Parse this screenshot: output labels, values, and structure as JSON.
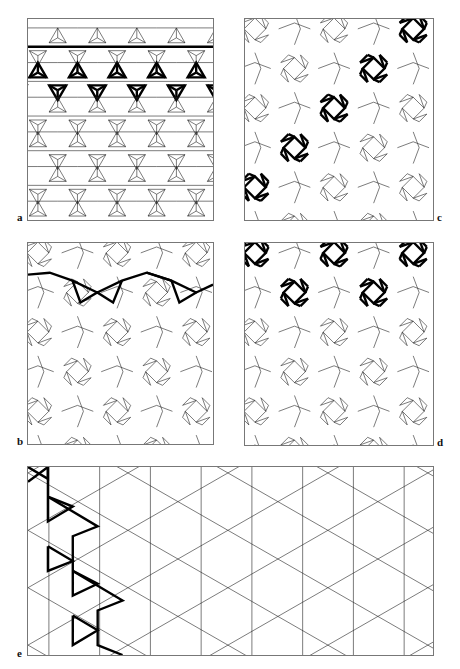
{
  "figure": {
    "panels": [
      {
        "id": "a",
        "label": "a",
        "description": "Triangular lattice of three-pointed stars with one highlighted horizontal row"
      },
      {
        "id": "b",
        "label": "b",
        "description": "Square-octagon lattice with highlighted zig-zag chain"
      },
      {
        "id": "c",
        "label": "c",
        "description": "Square lattice of cross motifs with highlighted diagonal chain"
      },
      {
        "id": "d",
        "label": "d",
        "description": "Square lattice of cross motifs with highlighted wavy chain"
      },
      {
        "id": "e",
        "label": "e",
        "description": "Kagome-like lattice of large triangles with highlighted zig-zag path"
      }
    ],
    "colors": {
      "line": "#222222",
      "highlight": "#000000",
      "frame": "#777777",
      "background": "#ffffff"
    }
  }
}
